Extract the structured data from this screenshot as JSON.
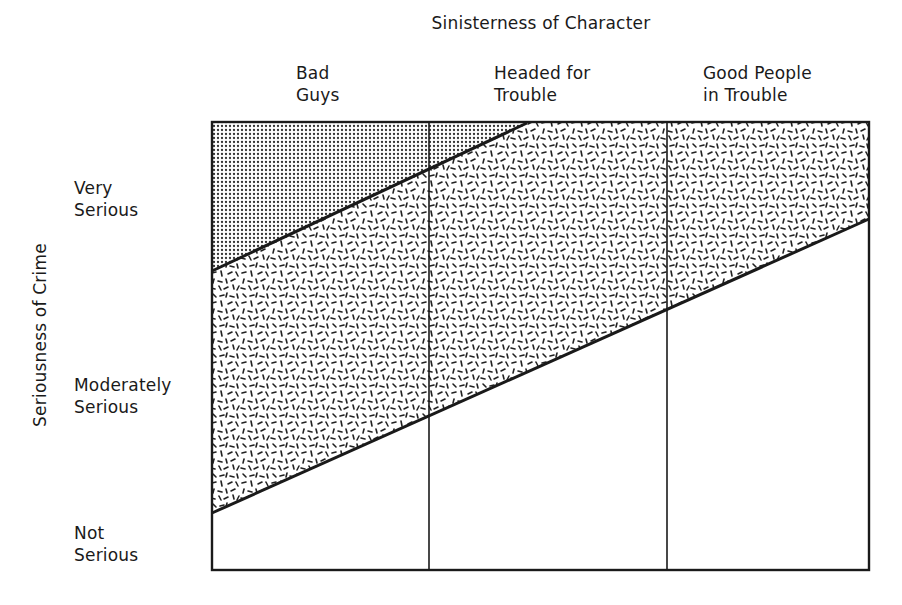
{
  "diagram": {
    "x_axis_title": "Sinisterness of Character",
    "y_axis_title": "Seriousness of Crime",
    "columns": [
      {
        "line1": "Bad",
        "line2": "Guys"
      },
      {
        "line1": "Headed for",
        "line2": "Trouble"
      },
      {
        "line1": "Good People",
        "line2": "in Trouble"
      }
    ],
    "rows": [
      {
        "line1": "Very",
        "line2": "Serious"
      },
      {
        "line1": "Moderately",
        "line2": "Serious"
      },
      {
        "line1": "Not",
        "line2": "Serious"
      }
    ],
    "regions": [
      {
        "name": "upper-left dense-dot region",
        "pattern": "fine dots (dark stipple)"
      },
      {
        "name": "middle band",
        "pattern": "random short dashes"
      },
      {
        "name": "lower-right region",
        "pattern": "blank (white)"
      }
    ],
    "colors": {
      "line": "#1a1a1a",
      "dense_fill": "#8a8a8a",
      "background": "#ffffff"
    }
  }
}
